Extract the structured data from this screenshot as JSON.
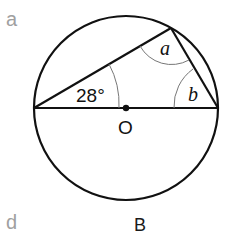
{
  "labels": {
    "top_left": "a",
    "bottom_left": "d",
    "caption": "B"
  },
  "diagram": {
    "angle_given": "28°",
    "angle_a": "a",
    "angle_b": "b",
    "center_label": "O"
  }
}
